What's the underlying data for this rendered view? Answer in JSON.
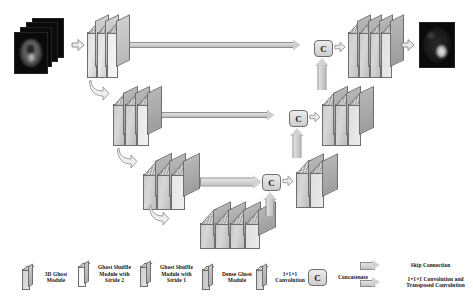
{
  "figure": {
    "domain": "Diagram"
  },
  "colors": {
    "slab_fill": "#cfcfcf",
    "slab_edge": "#6e6e6e",
    "arrow_fill": "#d2d2d2",
    "background": "#ffffff",
    "text": "#111111",
    "mri_background": "#0a0a0a",
    "lesion": "#e8e8e8"
  },
  "pipeline": {
    "input": {
      "name": "input-mri-stack",
      "description": "Stack of axial brain MRI slices",
      "slice_count": 4
    },
    "output": {
      "name": "output-segmentation",
      "description": "Predicted lesion segmentation map",
      "slice_count": 1
    },
    "levels": [
      {
        "id": "level-1",
        "encoder_blocks": 3,
        "decoder_blocks": 4,
        "concat": "C"
      },
      {
        "id": "level-2",
        "encoder_blocks": 3,
        "decoder_blocks": 3,
        "concat": "C"
      },
      {
        "id": "level-3",
        "encoder_blocks": 3,
        "decoder_blocks": 2,
        "concat": "C"
      }
    ],
    "bottleneck": {
      "id": "dense-ghost-bottleneck",
      "blocks": 4
    }
  },
  "nodes": {
    "concat_label": "C"
  },
  "legend": {
    "items": [
      {
        "icon": "ghost-module-slab",
        "label": "3D Ghost\nModule"
      },
      {
        "icon": "ghost-shuffle-stride2-slab",
        "label": "Ghost Shuffle\nModule with\nStride 2"
      },
      {
        "icon": "ghost-shuffle-stride1-slab",
        "label": "Ghost Shuffle\nModule with\nStride 1"
      },
      {
        "icon": "dense-ghost-slab",
        "label": "Dense Ghost\nModule"
      },
      {
        "icon": "conv1x1x1-slab",
        "label": "1×1×1\nConvolution"
      },
      {
        "icon": "concatenate-node",
        "label": "Concatenate"
      }
    ],
    "arrows": [
      {
        "icon": "skip-connection-arrow",
        "label": "Skip Connection"
      },
      {
        "icon": "transposed-conv-arrow",
        "label": "1×1×1 Convolution and\nTransposed Convolution"
      }
    ]
  }
}
